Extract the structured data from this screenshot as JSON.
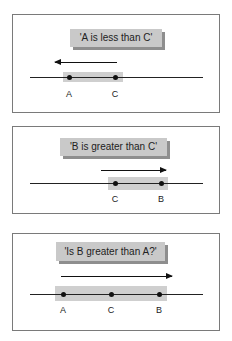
{
  "panels": [
    {
      "statement": "'A is less than C'",
      "arrow_direction": "left",
      "points": [
        {
          "label": "A"
        },
        {
          "label": "C"
        }
      ]
    },
    {
      "statement": "'B is greater than C'",
      "arrow_direction": "right",
      "points": [
        {
          "label": "C"
        },
        {
          "label": "B"
        }
      ]
    },
    {
      "statement": "'Is B greater than A?'",
      "arrow_direction": "right",
      "points": [
        {
          "label": "A"
        },
        {
          "label": "C"
        },
        {
          "label": "B"
        }
      ]
    }
  ],
  "colors": {
    "label_box": "#c9c9c9",
    "label_shadow": "#8e8e8e",
    "highlight": "#cfcfcf",
    "line": "#222222"
  }
}
